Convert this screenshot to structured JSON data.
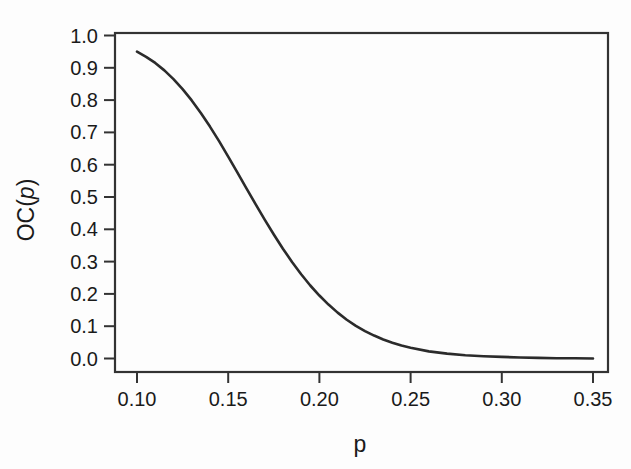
{
  "chart_data": {
    "type": "line",
    "title": "",
    "subtitle": "",
    "xlabel": "p",
    "ylabel": "OC(p)",
    "xlabel_style": "italic",
    "ylabel_style": "italic-p",
    "xlim": [
      0.1,
      0.35
    ],
    "ylim": [
      0.0,
      1.0
    ],
    "grid": false,
    "legend": null,
    "legend_position": "none",
    "xticks": [
      0.1,
      0.15,
      0.2,
      0.25,
      0.3,
      0.35
    ],
    "xtick_labels": [
      "0.10",
      "0.15",
      "0.20",
      "0.25",
      "0.30",
      "0.35"
    ],
    "yticks": [
      0.0,
      0.1,
      0.2,
      0.3,
      0.4,
      0.5,
      0.6,
      0.7,
      0.8,
      0.9,
      1.0
    ],
    "ytick_labels": [
      "0.0",
      "0.1",
      "0.2",
      "0.3",
      "0.4",
      "0.5",
      "0.6",
      "0.7",
      "0.8",
      "0.9",
      "1.0"
    ],
    "line_color": "#2b2b2b",
    "frame_color": "#333333",
    "background_color": "#fdfdfd",
    "series": [
      {
        "name": "OC(p)",
        "x": [
          0.1,
          0.105,
          0.11,
          0.115,
          0.12,
          0.125,
          0.13,
          0.135,
          0.14,
          0.145,
          0.15,
          0.155,
          0.16,
          0.165,
          0.17,
          0.175,
          0.18,
          0.185,
          0.19,
          0.195,
          0.2,
          0.205,
          0.21,
          0.215,
          0.22,
          0.225,
          0.23,
          0.235,
          0.24,
          0.245,
          0.25,
          0.26,
          0.27,
          0.28,
          0.29,
          0.3,
          0.31,
          0.32,
          0.33,
          0.34,
          0.35
        ],
        "y": [
          0.95,
          0.934,
          0.915,
          0.892,
          0.865,
          0.834,
          0.799,
          0.76,
          0.718,
          0.673,
          0.625,
          0.576,
          0.527,
          0.478,
          0.43,
          0.384,
          0.34,
          0.299,
          0.261,
          0.226,
          0.195,
          0.167,
          0.142,
          0.12,
          0.101,
          0.085,
          0.071,
          0.059,
          0.049,
          0.04,
          0.033,
          0.022,
          0.015,
          0.01,
          0.007,
          0.005,
          0.003,
          0.002,
          0.001,
          0.001,
          0.0
        ]
      }
    ]
  },
  "axes": {
    "y_axis_title": "OC(p)",
    "y_axis_title_prefix": "OC(",
    "y_axis_title_var": "p",
    "y_axis_title_suffix": ")",
    "x_axis_title": "p"
  }
}
